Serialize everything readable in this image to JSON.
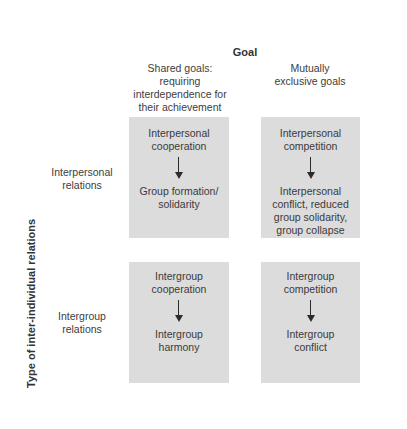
{
  "header": {
    "title": "Goal",
    "columns": [
      {
        "label": "Shared goals: requiring interdependence for their achievement",
        "lines": [
          "Shared goals:",
          "requiring",
          "interdependence for",
          "their achievement"
        ]
      },
      {
        "label": "Mutually exclusive goals",
        "lines": [
          "Mutually",
          "exclusive goals"
        ]
      }
    ]
  },
  "axis": {
    "vertical_title": "Type of inter-individual relations"
  },
  "rows": [
    {
      "lines": [
        "Interpersonal",
        "relations"
      ]
    },
    {
      "lines": [
        "Intergroup",
        "relations"
      ]
    }
  ],
  "cells": {
    "interpersonal_shared": {
      "cause_lines": [
        "Interpersonal",
        "cooperation"
      ],
      "effect_lines": [
        "Group formation/",
        "solidarity"
      ],
      "arrow": "down-arrow"
    },
    "interpersonal_exclusive": {
      "cause_lines": [
        "Interpersonal",
        "competition"
      ],
      "effect_lines": [
        "Interpersonal",
        "conflict, reduced",
        "group solidarity,",
        "group collapse"
      ],
      "arrow": "down-arrow"
    },
    "intergroup_shared": {
      "cause_lines": [
        "Intergroup",
        "cooperation"
      ],
      "effect_lines": [
        "Intergroup",
        "harmony"
      ],
      "arrow": "down-arrow"
    },
    "intergroup_exclusive": {
      "cause_lines": [
        "Intergroup",
        "competition"
      ],
      "effect_lines": [
        "Intergroup",
        "conflict"
      ],
      "arrow": "down-arrow"
    }
  },
  "colors": {
    "cell_background": "#dcdcdc",
    "text": "#3a3a3a",
    "arrow": "#2b2b2b",
    "page_background": "#ffffff"
  }
}
